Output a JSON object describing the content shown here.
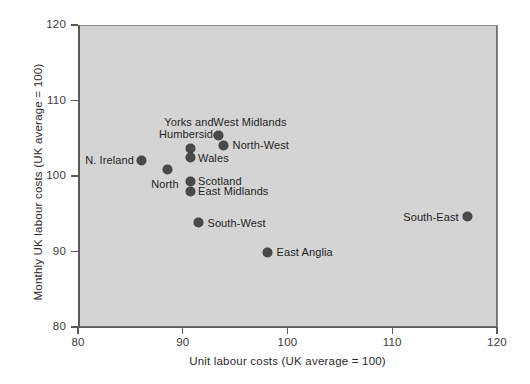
{
  "chart_data": {
    "type": "scatter",
    "title": "",
    "xlabel": "Unit labour costs (UK average = 100)",
    "ylabel": "Monthly UK labour costs (UK average = 100)",
    "xlim": [
      80,
      120
    ],
    "ylim": [
      80,
      120
    ],
    "xticks": [
      80,
      90,
      100,
      110,
      120
    ],
    "yticks": [
      80,
      90,
      100,
      110,
      120
    ],
    "grid": false,
    "legend": "none",
    "plot_background": "#d4d4d4",
    "marker_color": "#4a4a4a",
    "points": [
      {
        "label": "N. Ireland",
        "x": 86.1,
        "y": 102.1,
        "label_pos": "left",
        "label_dx": -8,
        "label_dy": 0
      },
      {
        "label": "North",
        "x": 88.5,
        "y": 100.8,
        "label_pos": "center",
        "label_dx": -2,
        "label_dy": 14
      },
      {
        "label": "Yorks and\nHumberside",
        "x": 90.7,
        "y": 103.7,
        "label_pos": "center",
        "label_dx": -1,
        "label_dy": -26
      },
      {
        "label": "Wales",
        "x": 90.7,
        "y": 102.4,
        "label_pos": "right",
        "label_dx": 8,
        "label_dy": 0
      },
      {
        "label": "Scotland",
        "x": 90.7,
        "y": 99.3,
        "label_pos": "right",
        "label_dx": 8,
        "label_dy": 0
      },
      {
        "label": "East Midlands",
        "x": 90.7,
        "y": 98.0,
        "label_pos": "right",
        "label_dx": 8,
        "label_dy": 0
      },
      {
        "label": "West Midlands",
        "x": 93.4,
        "y": 105.3,
        "label_pos": "right",
        "label_dx": -5,
        "label_dy": -14
      },
      {
        "label": "North-West",
        "x": 93.9,
        "y": 104.1,
        "label_pos": "right",
        "label_dx": 9,
        "label_dy": 0
      },
      {
        "label": "South-West",
        "x": 91.5,
        "y": 93.8,
        "label_pos": "right",
        "label_dx": 9,
        "label_dy": 0
      },
      {
        "label": "East Anglia",
        "x": 98.1,
        "y": 89.9,
        "label_pos": "right",
        "label_dx": 9,
        "label_dy": 0
      },
      {
        "label": "South-East",
        "x": 117.2,
        "y": 94.6,
        "label_pos": "left",
        "label_dx": -9,
        "label_dy": 0
      }
    ]
  }
}
